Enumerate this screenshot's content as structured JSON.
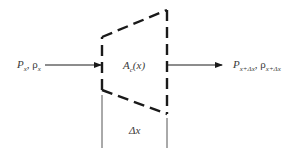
{
  "diagram": {
    "type": "control-volume",
    "inlet_label": {
      "P": "P",
      "P_sub": "x",
      "sep": ", ",
      "rho": "ρ",
      "rho_sub": "x"
    },
    "outlet_label": {
      "P": "P",
      "P_sub": "x+Δx",
      "sep": ", ",
      "rho": "ρ",
      "rho_sub": "x+Δx"
    },
    "area_label": {
      "A": "A",
      "A_sub": "c",
      "arg": "(x)"
    },
    "width_label": "Δx",
    "colors": {
      "stroke": "#1a1a1a",
      "thin": "#555555",
      "text": "#3a3a3a"
    }
  }
}
